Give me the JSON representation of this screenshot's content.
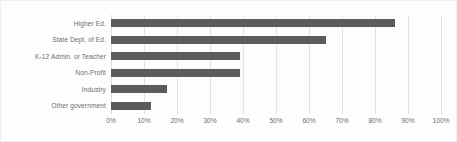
{
  "chart_data": {
    "type": "bar",
    "orientation": "horizontal",
    "title": "",
    "subtitle": "",
    "xlabel": "",
    "ylabel": "",
    "xlim": [
      0,
      100
    ],
    "xtick_labels": [
      "0%",
      "10%",
      "20%",
      "30%",
      "40%",
      "50%",
      "60%",
      "70%",
      "80%",
      "90%",
      "100%"
    ],
    "xtick_values": [
      0,
      10,
      20,
      30,
      40,
      50,
      60,
      70,
      80,
      90,
      100
    ],
    "grid": "vertical",
    "legend": "none",
    "value_suffix": "%",
    "categories": [
      "Higher Ed.",
      "State Dept. of Ed.",
      "K-12 Admin. or Teacher",
      "Non-Profit",
      "Industry",
      "Other government"
    ],
    "values": [
      86,
      65,
      39,
      39,
      17,
      12
    ],
    "series": [
      {
        "name": "Respondents",
        "values": [
          86,
          65,
          39,
          39,
          17,
          12
        ]
      }
    ]
  },
  "style": {
    "bar_color": "#5b5b5b",
    "grid_color": "#e4e4e4",
    "text_color": "#6d6d6d",
    "background": "#fdfdfd"
  }
}
